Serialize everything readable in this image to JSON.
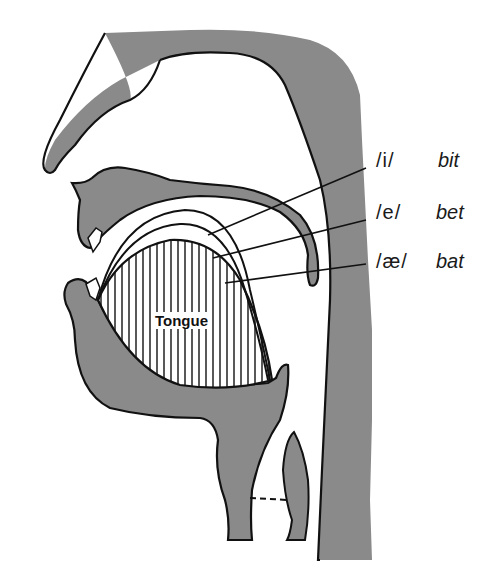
{
  "diagram": {
    "type": "midsagittal vocal tract cross-section",
    "colors": {
      "tissue": "#8a8a8a",
      "outline": "#111111",
      "background": "#ffffff"
    },
    "tongue_label": "Tongue",
    "vowels": [
      {
        "ipa": "/i/",
        "word": "bit"
      },
      {
        "ipa": "/e/",
        "word": "bet"
      },
      {
        "ipa": "/æ/",
        "word": "bat"
      }
    ]
  }
}
